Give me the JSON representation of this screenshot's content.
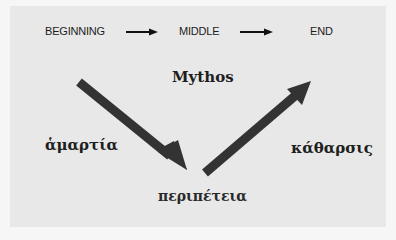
{
  "diagram": {
    "sequence": {
      "items": [
        "BEGINNING",
        "MIDDLE",
        "END"
      ],
      "connector": "right-arrow"
    },
    "title": "Mythos",
    "stages": {
      "left": "ἁμαρτία",
      "bottom": "περιπέτεια",
      "right": "κάθαρσις"
    },
    "arrows": [
      {
        "name": "descent-arrow",
        "from": "upper-left",
        "to": "bottom-center",
        "direction": "down-right"
      },
      {
        "name": "ascent-arrow",
        "from": "bottom-center",
        "to": "upper-right",
        "direction": "up-right"
      }
    ],
    "colors": {
      "background": "#e8e8e8",
      "arrow": "#333333",
      "text": "#1e1e1e"
    }
  }
}
